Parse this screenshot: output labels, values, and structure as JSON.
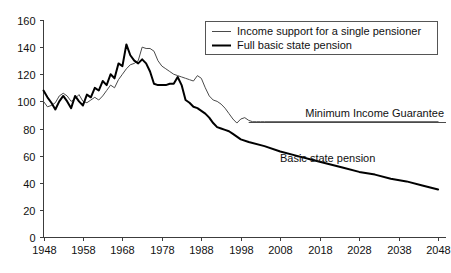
{
  "chart_data": {
    "type": "line",
    "title": "",
    "xlabel": "",
    "ylabel": "",
    "xlim": [
      1948,
      2050
    ],
    "ylim": [
      0,
      160
    ],
    "grid": false,
    "legend_position": "top-right",
    "x_ticks": [
      "1948",
      "1958",
      "1968",
      "1978",
      "1988",
      "1998",
      "2008",
      "2018",
      "2028",
      "2038",
      "2048"
    ],
    "x_tick_values": [
      1948,
      1958,
      1968,
      1978,
      1988,
      1998,
      2008,
      2018,
      2028,
      2038,
      2048
    ],
    "y_ticks": [
      "0",
      "20",
      "40",
      "60",
      "80",
      "100",
      "120",
      "140",
      "160"
    ],
    "y_tick_values": [
      0,
      20,
      40,
      60,
      80,
      100,
      120,
      140,
      160
    ],
    "series": [
      {
        "name": "Income support for a single pensioner",
        "style": "thin",
        "color": "#4a4a4a",
        "x": [
          1948,
          1949,
          1950,
          1951,
          1952,
          1953,
          1954,
          1955,
          1956,
          1957,
          1958,
          1959,
          1960,
          1961,
          1962,
          1963,
          1964,
          1965,
          1966,
          1967,
          1968,
          1969,
          1970,
          1971,
          1972,
          1973,
          1974,
          1975,
          1976,
          1977,
          1978,
          1979,
          1980,
          1981,
          1982,
          1983,
          1984,
          1985,
          1986,
          1987,
          1988,
          1989,
          1990,
          1991,
          1992,
          1993,
          1994,
          1995,
          1996,
          1997,
          1998,
          1999,
          2000,
          2001,
          2002,
          2003,
          2004,
          2048
        ],
        "y": [
          100,
          96,
          97,
          99,
          104,
          106,
          104,
          100,
          102,
          105,
          100,
          99,
          101,
          103,
          101,
          104,
          108,
          112,
          110,
          116,
          120,
          124,
          127,
          128,
          130,
          140,
          139,
          139,
          137,
          130,
          126,
          124,
          122,
          120,
          119,
          118,
          117,
          116,
          115,
          119,
          117,
          110,
          104,
          101,
          100,
          98,
          95,
          91,
          87,
          84,
          87,
          88,
          86,
          85,
          85,
          85,
          85,
          85
        ]
      },
      {
        "name": "Full basic state pension",
        "style": "thick",
        "color": "#000000",
        "x": [
          1948,
          1949,
          1950,
          1951,
          1952,
          1953,
          1954,
          1955,
          1956,
          1957,
          1958,
          1959,
          1960,
          1961,
          1962,
          1963,
          1964,
          1965,
          1966,
          1967,
          1968,
          1969,
          1970,
          1971,
          1972,
          1973,
          1974,
          1975,
          1976,
          1977,
          1978,
          1979,
          1980,
          1981,
          1982,
          1983,
          1984,
          1985,
          1986,
          1987,
          1988,
          1989,
          1990,
          1991,
          1992,
          1993,
          1994,
          1995,
          1996,
          1997,
          1998,
          2000,
          2004,
          2008,
          2012,
          2016,
          2020,
          2024,
          2028,
          2032,
          2036,
          2040,
          2044,
          2048
        ],
        "y": [
          108,
          103,
          99,
          94,
          100,
          104,
          100,
          95,
          104,
          100,
          97,
          105,
          103,
          110,
          108,
          115,
          112,
          120,
          117,
          128,
          126,
          142,
          134,
          130,
          128,
          131,
          128,
          122,
          113,
          112,
          112,
          112,
          113,
          113,
          118,
          112,
          101,
          99,
          96,
          95,
          93,
          91,
          88,
          84,
          81,
          80,
          79,
          78,
          76,
          74,
          72,
          70,
          67,
          63,
          60,
          57,
          54,
          51,
          48,
          46,
          43,
          41,
          38,
          35
        ]
      }
    ],
    "annotations": [
      {
        "name": "minimum-income-guarantee",
        "text": "Minimum Income Guarantee",
        "value": 85,
        "x_start": 2000,
        "x_end": 2050
      },
      {
        "name": "basic-state-pension",
        "text": "Basic state pension",
        "x": 2020,
        "y": 55
      }
    ]
  },
  "legend": {
    "entries": [
      {
        "label": "Income support for a single pensioner",
        "style": "thin"
      },
      {
        "label": "Full basic state pension",
        "style": "thick"
      }
    ]
  }
}
